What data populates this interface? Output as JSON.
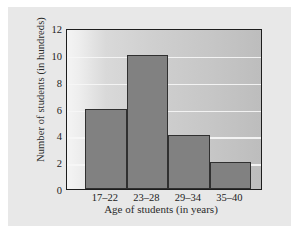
{
  "chart_data": {
    "type": "bar",
    "title": "",
    "subtitle": "",
    "categories": [
      "17–22",
      "23–28",
      "29–34",
      "35–40"
    ],
    "values": [
      6,
      10,
      4,
      2
    ],
    "xlabel": "Age of students (in years)",
    "ylabel": "Number of students (in hundreds)",
    "ylim": [
      0,
      12
    ],
    "yticks": [
      0,
      2,
      4,
      6,
      8,
      10,
      12
    ],
    "ytick_labels": [
      "0",
      "2",
      "4",
      "6",
      "8",
      "10",
      "12"
    ],
    "grid": true,
    "grid_axis": "y",
    "legend": null,
    "legend_position": "none",
    "bar_color": "#818181",
    "bar_edge_color": "#303030",
    "plot_background": "#cfcfcf",
    "page_background": "#e8e8e8",
    "gridline_color": "#f6f6f6",
    "axis_color": "#1d1d1d",
    "text_color": "#222222"
  }
}
